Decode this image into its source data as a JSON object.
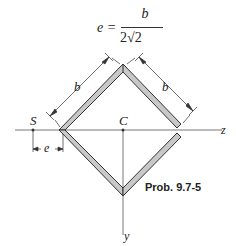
{
  "equation": {
    "lhs": "e =",
    "numerator": "b",
    "denominator": "2√2"
  },
  "labels": {
    "b_left": "b",
    "b_right": "b",
    "shear_center": "S",
    "centroid": "C",
    "z_axis": "z",
    "y_axis": "y",
    "e_dim": "e"
  },
  "caption": "Prob. 9.7-5",
  "colors": {
    "section_fill": "#c8c8c8",
    "section_stroke": "#333333",
    "axis_line": "#555555"
  }
}
